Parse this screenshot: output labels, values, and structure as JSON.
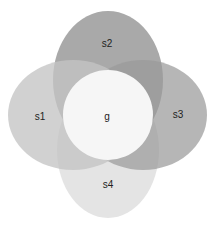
{
  "diagram": {
    "type": "venn-flower",
    "width": 216,
    "height": 225,
    "background": "#ffffff",
    "shapes": [
      {
        "id": "s4",
        "label": "s4",
        "kind": "ellipse",
        "cx": 108,
        "cy": 150,
        "rx": 51,
        "ry": 68,
        "fill": "#e4e4e4",
        "opacity": 1.0,
        "label_x": 108,
        "label_y": 188
      },
      {
        "id": "s2",
        "label": "s2",
        "kind": "ellipse",
        "cx": 108,
        "cy": 80,
        "rx": 55,
        "ry": 69,
        "fill": "#a9a9a9",
        "opacity": 1.0,
        "label_x": 107,
        "label_y": 47
      },
      {
        "id": "s3",
        "label": "s3",
        "kind": "ellipse",
        "cx": 143,
        "cy": 115,
        "rx": 64,
        "ry": 55,
        "fill": "#9a9a9a",
        "opacity": 0.72,
        "label_x": 178,
        "label_y": 118
      },
      {
        "id": "s1",
        "label": "s1",
        "kind": "ellipse",
        "cx": 73,
        "cy": 115,
        "rx": 65,
        "ry": 55,
        "fill": "#c4c4c4",
        "opacity": 0.78,
        "label_x": 40,
        "label_y": 120
      },
      {
        "id": "g",
        "label": "g",
        "kind": "circle",
        "cx": 108,
        "cy": 115,
        "r": 45,
        "fill": "#f6f6f6",
        "opacity": 1.0,
        "label_x": 107,
        "label_y": 120
      }
    ]
  },
  "labels": {
    "s1": "s1",
    "s2": "s2",
    "s3": "s3",
    "s4": "s4",
    "g": "g"
  }
}
